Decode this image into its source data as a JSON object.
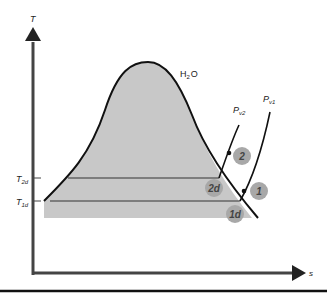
{
  "diagram": {
    "substance_label": "H",
    "substance_sub": "2",
    "substance_tail": "O",
    "axes": {
      "y_label": "T",
      "x_label": "s",
      "tick_labels": [
        {
          "main": "T",
          "sub": "2d"
        },
        {
          "main": "T",
          "sub": "1d"
        }
      ]
    },
    "isobars": [
      {
        "main": "P",
        "sub": "v2"
      },
      {
        "main": "P",
        "sub": "v1"
      }
    ],
    "points": [
      {
        "id": "2",
        "label": "2"
      },
      {
        "id": "2d",
        "label": "2d"
      },
      {
        "id": "1",
        "label": "1"
      },
      {
        "id": "1d",
        "label": "1d"
      }
    ],
    "colors": {
      "dome_fill": "#c8c8c8",
      "line": "#111111",
      "axis": "#444444",
      "point_fill": "#a8a8a8"
    }
  }
}
